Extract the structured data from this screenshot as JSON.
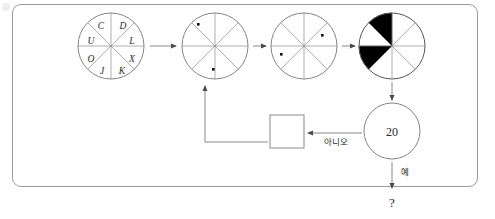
{
  "page": {
    "background_color": "#ffffff",
    "frame_color": "#9a9a9a",
    "width": 495,
    "height": 219
  },
  "diagram": {
    "type": "flowchart",
    "wheels": [
      {
        "id": "wheel-1",
        "name": "lettered-wheel",
        "cx": 111,
        "cy": 46,
        "r": 33,
        "sectors": 8,
        "letters_clockwise_from_top": [
          "D",
          "L",
          "X",
          "K",
          "J",
          "O",
          "U",
          "C"
        ],
        "letters": [
          {
            "char": "C",
            "x": 101,
            "y": 25
          },
          {
            "char": "D",
            "x": 124,
            "y": 25
          },
          {
            "char": "U",
            "x": 90,
            "y": 41
          },
          {
            "char": "L",
            "x": 133,
            "y": 41
          },
          {
            "char": "O",
            "x": 90,
            "y": 59
          },
          {
            "char": "X",
            "x": 133,
            "y": 59
          },
          {
            "char": "J",
            "x": 102,
            "y": 71
          },
          {
            "char": "K",
            "x": 123,
            "y": 71
          }
        ],
        "markers": []
      },
      {
        "id": "wheel-2",
        "name": "two-dot-wheel",
        "cx": 215,
        "cy": 46,
        "r": 33,
        "sectors": 8,
        "letters": [],
        "markers": [
          {
            "label": "upper-left-dot",
            "x": 198,
            "y": 24
          },
          {
            "label": "lower-right-dot",
            "x": 213,
            "y": 70
          }
        ]
      },
      {
        "id": "wheel-3",
        "name": "rotated-two-dot-wheel",
        "cx": 304,
        "cy": 46,
        "r": 33,
        "sectors": 8,
        "letters": [],
        "markers": [
          {
            "label": "upper-right-dot",
            "x": 322,
            "y": 35
          },
          {
            "label": "lower-left-dot",
            "x": 281,
            "y": 54
          }
        ]
      },
      {
        "id": "wheel-4",
        "name": "shaded-wheel",
        "cx": 392,
        "cy": 46,
        "r": 33,
        "sectors": 8,
        "letters": [],
        "markers": [],
        "filled_sectors_clock_positions": [
          "10:30-12:00",
          "7:30-9:00"
        ]
      }
    ],
    "decision_node": {
      "name": "decision-circle",
      "value": "20",
      "cx": 392,
      "cy": 131,
      "r": 28
    },
    "process_box": {
      "name": "empty-process-box",
      "value": "",
      "x": 270,
      "y": 115,
      "width": 34,
      "height": 33
    },
    "terminal": {
      "name": "question-terminal",
      "value": "?",
      "x": 389,
      "y": 203
    },
    "branch_labels": {
      "no": "아니오",
      "yes": "예"
    },
    "arrows": [
      {
        "name": "arrow-wheel1-to-wheel2",
        "from": "wheel-1",
        "to": "wheel-2",
        "direction": "right"
      },
      {
        "name": "arrow-wheel2-to-wheel3",
        "from": "wheel-2",
        "to": "wheel-3",
        "direction": "right"
      },
      {
        "name": "arrow-wheel3-to-wheel4",
        "from": "wheel-3",
        "to": "wheel-4",
        "direction": "right"
      },
      {
        "name": "arrow-wheel4-to-decision",
        "from": "wheel-4",
        "to": "decision-circle",
        "direction": "down"
      },
      {
        "name": "arrow-decision-to-box",
        "from": "decision-circle",
        "to": "process-box",
        "direction": "left",
        "label": "아니오"
      },
      {
        "name": "arrow-box-to-wheel2",
        "from": "process-box",
        "to": "wheel-2",
        "direction": "up-left-elbow"
      },
      {
        "name": "arrow-decision-to-terminal",
        "from": "decision-circle",
        "to": "question-terminal",
        "direction": "down",
        "label": "예"
      }
    ]
  }
}
